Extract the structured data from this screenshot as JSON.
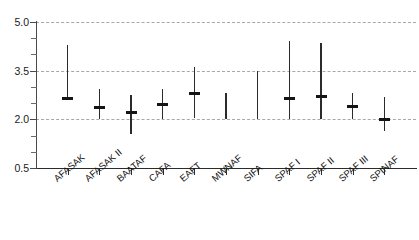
{
  "chart_data": {
    "type": "scatter",
    "plot_style": "interval-range-plot",
    "title": "",
    "subtitle": "",
    "xlabel": "",
    "ylabel": "",
    "ylim": [
      0.5,
      5.0
    ],
    "grid": true,
    "gridlines_at": [
      2.0,
      3.5,
      5.0
    ],
    "legend": "none",
    "y_tick_labels": [
      "0.5",
      "2.0",
      "3.5",
      "5.0"
    ],
    "y_tick_values": [
      0.5,
      2.0,
      3.5,
      5.0
    ],
    "y_minor_tick_values": [
      1.0,
      1.5,
      2.5,
      3.0,
      4.0,
      4.5
    ],
    "categories": [
      "AFASAK",
      "AFASAK II",
      "BAATAF",
      "CAFA",
      "EAFT",
      "MWNAF",
      "SIFA",
      "SPAF I",
      "SPAF II",
      "SPAF III",
      "SPINAF"
    ],
    "series": [
      {
        "name": "Range with point estimate",
        "points": [
          {
            "category": "AFASAK",
            "value": 2.65,
            "low": 2.6,
            "high": 4.3,
            "has_marker": true
          },
          {
            "category": "AFASAK II",
            "value": 2.35,
            "low": 2.0,
            "high": 2.95,
            "has_marker": true
          },
          {
            "category": "BAATAF",
            "value": 2.2,
            "low": 1.55,
            "high": 2.75,
            "has_marker": true
          },
          {
            "category": "CAFA",
            "value": 2.45,
            "low": 2.0,
            "high": 2.95,
            "has_marker": true
          },
          {
            "category": "EAFT",
            "value": 2.8,
            "low": 2.05,
            "high": 3.6,
            "has_marker": true
          },
          {
            "category": "MWNAF",
            "value": null,
            "low": 2.0,
            "high": 2.8,
            "has_marker": false
          },
          {
            "category": "SIFA",
            "value": null,
            "low": 2.0,
            "high": 3.5,
            "has_marker": false
          },
          {
            "category": "SPAF I",
            "value": 2.65,
            "low": 2.0,
            "high": 4.4,
            "has_marker": true
          },
          {
            "category": "SPAF II",
            "value": 2.7,
            "low": 2.0,
            "high": 4.35,
            "has_marker": true
          },
          {
            "category": "SPAF III",
            "value": 2.4,
            "low": 2.0,
            "high": 2.8,
            "has_marker": true
          },
          {
            "category": "SPINAF",
            "value": 2.0,
            "low": 1.65,
            "high": 2.7,
            "has_marker": true
          }
        ]
      }
    ]
  }
}
